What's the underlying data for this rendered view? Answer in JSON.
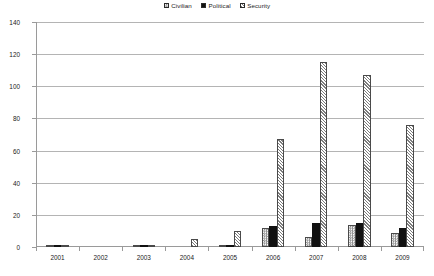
{
  "legend": {
    "position": "top-center",
    "entries": [
      {
        "label": "Civilian",
        "key": "civilian",
        "pattern": "checker-hatch"
      },
      {
        "label": "Political",
        "key": "political",
        "pattern": "solid-black"
      },
      {
        "label": "Security",
        "key": "security",
        "pattern": "diagonal-hatch"
      }
    ]
  },
  "axes": {
    "y_ticks": [
      0,
      20,
      40,
      60,
      80,
      100,
      120,
      140
    ],
    "x_ticks": [
      "2001",
      "2002",
      "2003",
      "2004",
      "2005",
      "2006",
      "2007",
      "2008",
      "2009"
    ]
  },
  "chart_data": {
    "type": "bar",
    "title": "",
    "subtitle": "",
    "xlabel": "",
    "ylabel": "",
    "ylim": [
      0,
      140
    ],
    "ytick_step": 20,
    "grid": true,
    "legend_position": "top-center",
    "categories": [
      "2001",
      "2002",
      "2003",
      "2004",
      "2005",
      "2006",
      "2007",
      "2008",
      "2009"
    ],
    "series": [
      {
        "name": "Civilian",
        "values": [
          1,
          0,
          1,
          0,
          1,
          12,
          6,
          14,
          9
        ]
      },
      {
        "name": "Political",
        "values": [
          1,
          0,
          1,
          0,
          1,
          13,
          15,
          15,
          12
        ]
      },
      {
        "name": "Security",
        "values": [
          1,
          0,
          1,
          5,
          10,
          67,
          115,
          107,
          76
        ]
      }
    ]
  },
  "colors": {
    "axis": "#9a9a9a",
    "gridline": "#b4b4b4",
    "text": "#1a1a1a",
    "civilian_fill": "#8c8c8c",
    "political_fill": "#111111",
    "security_fill": "#7d7d7d",
    "background": "#ffffff"
  }
}
